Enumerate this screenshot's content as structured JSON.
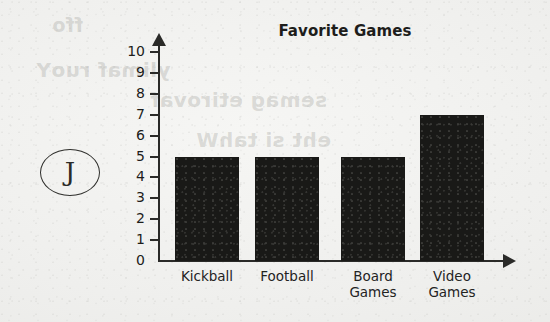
{
  "marker": {
    "letter": "J"
  },
  "ghost_text": {
    "line1": "ffo",
    "line2": "ylimaf ruoY",
    "line3": "semag etirovaf",
    "line4": "eht si tahW"
  },
  "chart_data": {
    "type": "bar",
    "title": "Favorite Games",
    "xlabel": "",
    "ylabel": "",
    "categories": [
      "Kickball",
      "Football",
      "Board Games",
      "Video Games"
    ],
    "category_lines": [
      [
        "Kickball"
      ],
      [
        "Football"
      ],
      [
        "Board",
        "Games"
      ],
      [
        "Video",
        "Games"
      ]
    ],
    "values": [
      5,
      5,
      5,
      7
    ],
    "ylim": [
      0,
      10
    ],
    "ytick_labels": [
      "0",
      "1",
      "2",
      "3",
      "4",
      "5",
      "6",
      "7",
      "8",
      "9",
      "10"
    ],
    "ytick_values": [
      0,
      1,
      2,
      3,
      4,
      5,
      6,
      7,
      8,
      9,
      10
    ],
    "grid": false,
    "legend": null,
    "bar_color": "#191917",
    "axis_color": "#2a2a28"
  }
}
